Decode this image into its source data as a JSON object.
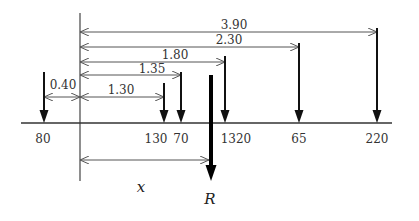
{
  "diagram": {
    "colors": {
      "line": "#333333",
      "arrow": "#111111",
      "dim": "#555555"
    },
    "dimensions": [
      {
        "id": "d390",
        "label": "3.90"
      },
      {
        "id": "d230",
        "label": "2.30"
      },
      {
        "id": "d180",
        "label": "1.80"
      },
      {
        "id": "d135",
        "label": "1.35"
      },
      {
        "id": "d130",
        "label": "1.30"
      },
      {
        "id": "d040",
        "label": "0.40"
      }
    ],
    "loads": [
      {
        "id": "l80",
        "label": "80"
      },
      {
        "id": "l130",
        "label": "130"
      },
      {
        "id": "l70",
        "label": "70"
      },
      {
        "id": "l1320",
        "label": "1320"
      },
      {
        "id": "l65",
        "label": "65"
      },
      {
        "id": "l220",
        "label": "220"
      }
    ],
    "resultant_label": "R",
    "distance_label": "x"
  }
}
